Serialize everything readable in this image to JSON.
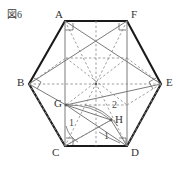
{
  "figure": {
    "caption": "図6",
    "shape": "regular-hexagon",
    "colors": {
      "outline": "#1a1a1a",
      "solid_inner": "#6b6b6b",
      "dashed_inner": "#8c8c8c",
      "arc": "#7a7a7a",
      "label_text": "#333333",
      "caption_text": "#3a3a3a",
      "background": "#ffffff"
    },
    "vertices": [
      {
        "id": "A",
        "label": "A",
        "x": 65,
        "y": 21,
        "label_x": 55,
        "label_y": 12
      },
      {
        "id": "F",
        "label": "F",
        "x": 127,
        "y": 21,
        "label_x": 132,
        "label_y": 12
      },
      {
        "id": "E",
        "label": "E",
        "x": 161,
        "y": 84,
        "label_x": 167,
        "label_y": 78
      },
      {
        "id": "D",
        "label": "D",
        "x": 127,
        "y": 146,
        "label_x": 132,
        "label_y": 148
      },
      {
        "id": "C",
        "label": "C",
        "x": 65,
        "y": 146,
        "label_x": 53,
        "label_y": 148
      },
      {
        "id": "B",
        "label": "B",
        "x": 29,
        "y": 84,
        "label_x": 18,
        "label_y": 78
      }
    ],
    "interior_points": [
      {
        "id": "G",
        "label": "G",
        "x": 66,
        "y": 105,
        "label_x": 55,
        "label_y": 99
      },
      {
        "id": "H",
        "label": "H",
        "x": 111,
        "y": 120,
        "label_x": 116,
        "label_y": 115
      }
    ],
    "angle_marks": [
      {
        "id": "angle-1-left",
        "label": "1",
        "x": 71,
        "y": 122
      },
      {
        "id": "angle-2-mid",
        "label": "2",
        "x": 114,
        "y": 105
      },
      {
        "id": "angle-1-right",
        "label": "1",
        "x": 106,
        "y": 135
      }
    ],
    "right_angle_vertices": [
      "A",
      "B",
      "C",
      "D",
      "E",
      "F"
    ]
  }
}
